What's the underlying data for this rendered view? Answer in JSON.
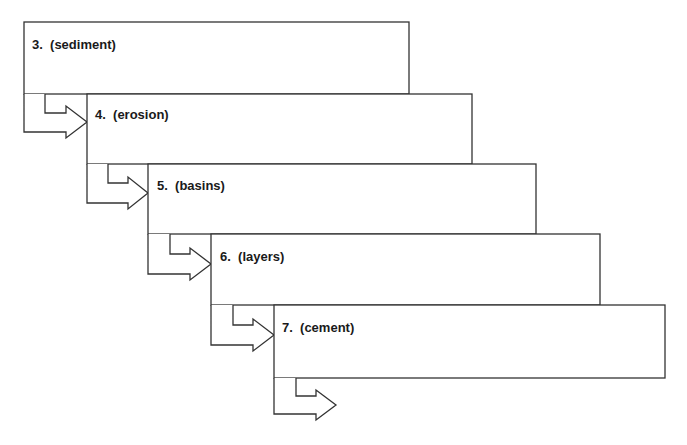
{
  "diagram": {
    "type": "sequential-flow-boxes",
    "stroke_color": "#333333",
    "background": "#ffffff",
    "steps": [
      {
        "number": "3.",
        "term": "(sediment)",
        "label": "3.  (sediment)"
      },
      {
        "number": "4.",
        "term": "(erosion)",
        "label": "4.  (erosion)"
      },
      {
        "number": "5.",
        "term": "(basins)",
        "label": "5.  (basins)"
      },
      {
        "number": "6.",
        "term": "(layers)",
        "label": "6.  (layers)"
      },
      {
        "number": "7.",
        "term": "(cement)",
        "label": "7.  (cement)"
      }
    ]
  }
}
